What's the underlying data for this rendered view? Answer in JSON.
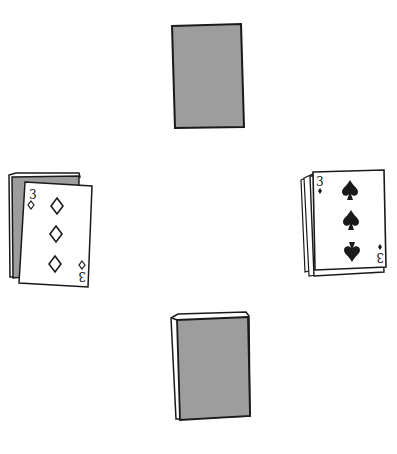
{
  "scene": {
    "description": "Four card positions around a table",
    "colors": {
      "background": "#ffffff",
      "card_back": "#9d9d9d",
      "card_face": "#ffffff",
      "outline": "#1a1a1a"
    }
  },
  "north": {
    "label": "face-down card"
  },
  "south": {
    "label": "face-down deck"
  },
  "west": {
    "card": {
      "rank": "3",
      "suit": "diamonds",
      "suit_glyph": "◇"
    }
  },
  "east": {
    "card": {
      "rank": "3",
      "suit": "spades",
      "suit_glyph": "♠"
    }
  }
}
